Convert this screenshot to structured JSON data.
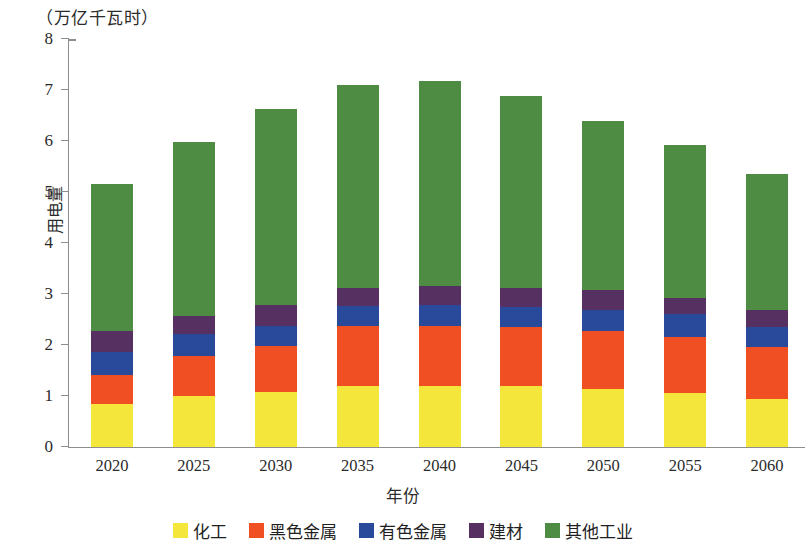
{
  "chart_data": {
    "type": "bar",
    "stacked": true,
    "title": "（万亿千瓦时）",
    "xlabel": "年份",
    "ylabel": "用电量",
    "unit": "万亿千瓦时",
    "categories": [
      "2020",
      "2025",
      "2030",
      "2035",
      "2040",
      "2045",
      "2050",
      "2055",
      "2060"
    ],
    "series": [
      {
        "name": "化工",
        "color": "#f5e63c",
        "values": [
          0.84,
          1.0,
          1.08,
          1.2,
          1.2,
          1.2,
          1.14,
          1.06,
          0.94
        ]
      },
      {
        "name": "黑色金属",
        "color": "#f04e23",
        "values": [
          0.57,
          0.78,
          0.9,
          1.17,
          1.17,
          1.15,
          1.13,
          1.1,
          1.02
        ]
      },
      {
        "name": "有色金属",
        "color": "#29499a",
        "values": [
          0.45,
          0.43,
          0.39,
          0.39,
          0.41,
          0.39,
          0.42,
          0.45,
          0.39
        ]
      },
      {
        "name": "建材",
        "color": "#563060",
        "values": [
          0.41,
          0.36,
          0.41,
          0.36,
          0.38,
          0.38,
          0.39,
          0.31,
          0.34
        ]
      },
      {
        "name": "其他工业",
        "color": "#4e8b43",
        "values": [
          2.89,
          3.42,
          3.85,
          3.98,
          4.01,
          3.76,
          3.31,
          3.0,
          2.66
        ]
      }
    ],
    "totals": [
      5.16,
      5.99,
      6.63,
      7.1,
      7.17,
      6.88,
      6.39,
      5.92,
      5.35
    ],
    "yticks": [
      0,
      1,
      2,
      3,
      4,
      5,
      6,
      7,
      8
    ],
    "ylim": [
      0,
      8
    ],
    "grid": false,
    "legend_position": "bottom"
  },
  "legend": {
    "items": [
      {
        "label": "化工",
        "color": "#f5e63c"
      },
      {
        "label": "黑色金属",
        "color": "#f04e23"
      },
      {
        "label": "有色金属",
        "color": "#29499a"
      },
      {
        "label": "建材",
        "color": "#563060"
      },
      {
        "label": "其他工业",
        "color": "#4e8b43"
      }
    ]
  }
}
